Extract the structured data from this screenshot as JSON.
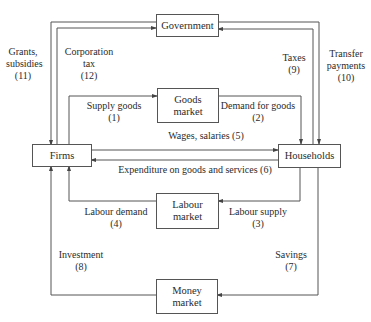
{
  "nodes": {
    "government": {
      "label": "Government"
    },
    "goods_market": {
      "line1": "Goods",
      "line2": "market"
    },
    "firms": {
      "label": "Firms"
    },
    "households": {
      "label": "Households"
    },
    "labour_market": {
      "line1": "Labour",
      "line2": "market"
    },
    "money_market": {
      "line1": "Money",
      "line2": "market"
    }
  },
  "flows": {
    "f1": {
      "text": "Supply goods",
      "num": "(1)"
    },
    "f2": {
      "text": "Demand for goods",
      "num": "(2)"
    },
    "f3": {
      "text": "Labour supply",
      "num": "(3)"
    },
    "f4": {
      "text": "Labour demand",
      "num": "(4)"
    },
    "f5": {
      "text": "Wages, salaries (5)"
    },
    "f6": {
      "text": "Expenditure on goods and services (6)"
    },
    "f7": {
      "text": "Savings",
      "num": "(7)"
    },
    "f8": {
      "text": "Investment",
      "num": "(8)"
    },
    "f9": {
      "text": "Taxes",
      "num": "(9)"
    },
    "f10": {
      "line1": "Transfer",
      "line2": "payments",
      "num": "(10)"
    },
    "f11": {
      "line1": "Grants,",
      "line2": "subsidies",
      "num": "(11)"
    },
    "f12": {
      "line1": "Corporation",
      "line2": "tax",
      "num": "(12)"
    }
  },
  "colors": {
    "line": "#555555",
    "text": "#2b2b2b"
  }
}
